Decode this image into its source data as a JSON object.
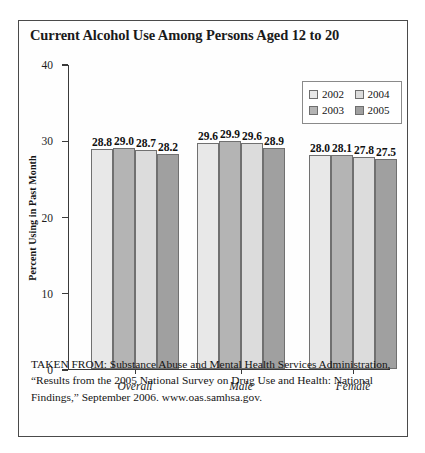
{
  "figure": {
    "title": "Current Alcohol Use Among Persons Aged 12 to 20",
    "source_note": "TAKEN FROM: Substance Abuse and Mental Health Services Administration, “Results from the 2005 National Survey on Drug Use and Health: National Findings,” September 2006. www.oas.samhsa.gov."
  },
  "colors": {
    "series_2002": "#e8e8e8",
    "series_2003": "#b4b4b4",
    "series_2004": "#dcdcdc",
    "series_2005": "#a0a0a0",
    "frame_border": "#4a4a4a",
    "axis": "#3a3a3a",
    "bar_outline": "#707070"
  },
  "legend": {
    "entries": [
      {
        "label": "2002",
        "swatch": "#e8e8e8"
      },
      {
        "label": "2004",
        "swatch": "#dcdcdc"
      },
      {
        "label": "2003",
        "swatch": "#b4b4b4"
      },
      {
        "label": "2005",
        "swatch": "#a0a0a0"
      }
    ]
  },
  "chart_data": {
    "type": "bar",
    "title": "Current Alcohol Use Among Persons Aged 12 to 20",
    "xlabel": "",
    "ylabel": "Percent Using in Past Month",
    "ylim": [
      0,
      40
    ],
    "yticks": [
      0,
      10,
      20,
      30,
      40
    ],
    "ytick_labels": [
      "0",
      "10",
      "20",
      "30",
      "40"
    ],
    "grid": false,
    "legend_position": "upper right",
    "categories": [
      "Overall",
      "Male",
      "Female"
    ],
    "series": [
      {
        "name": "2002",
        "color": "#e8e8e8",
        "values": [
          28.8,
          29.6,
          28.0
        ]
      },
      {
        "name": "2003",
        "color": "#b4b4b4",
        "values": [
          29.0,
          29.9,
          28.1
        ]
      },
      {
        "name": "2004",
        "color": "#dcdcdc",
        "values": [
          28.7,
          29.6,
          27.8
        ]
      },
      {
        "name": "2005",
        "color": "#a0a0a0",
        "values": [
          28.2,
          28.9,
          27.5
        ]
      }
    ],
    "data_labels": [
      [
        "28.8",
        "29.0",
        "28.7",
        "28.2"
      ],
      [
        "29.6",
        "29.9",
        "29.6",
        "28.9"
      ],
      [
        "28.0",
        "28.1",
        "27.8",
        "27.5"
      ]
    ]
  }
}
